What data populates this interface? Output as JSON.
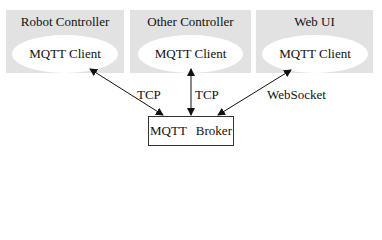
{
  "panels": [
    {
      "title": "Robot Controller",
      "client": "MQTT Client"
    },
    {
      "title": "Other Controller",
      "client": "MQTT Client"
    },
    {
      "title": "Web UI",
      "client": "MQTT Client"
    }
  ],
  "broker": {
    "label": "MQTT Broker"
  },
  "edges": [
    {
      "from": "Robot Controller",
      "to": "MQTT Broker",
      "label": "TCP"
    },
    {
      "from": "Other Controller",
      "to": "MQTT Broker",
      "label": "TCP"
    },
    {
      "from": "Web UI",
      "to": "MQTT Broker",
      "label": "WebSocket"
    }
  ],
  "colors": {
    "panel_bg": "#e2e2e2",
    "ellipse_bg": "#ffffff",
    "line": "#111111"
  }
}
